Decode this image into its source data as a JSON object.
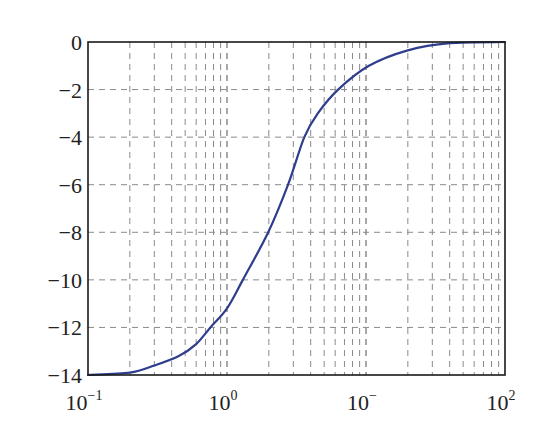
{
  "chart_data": {
    "type": "line",
    "title": "",
    "xlabel": "",
    "ylabel": "",
    "xscale": "log",
    "xlim": [
      0.1,
      100
    ],
    "ylim": [
      -14,
      0
    ],
    "grid": true,
    "grid_style": "dashed",
    "legend": null,
    "x_tick_labels": [
      {
        "base": "10",
        "exp": "−1",
        "value": 0.1
      },
      {
        "base": "10",
        "exp": "0",
        "value": 1
      },
      {
        "base": "10",
        "exp": "−",
        "value": 10
      },
      {
        "base": "10",
        "exp": "2",
        "value": 100
      }
    ],
    "y_ticks": [
      0,
      -2,
      -4,
      -6,
      -8,
      -10,
      -12,
      -14
    ],
    "y_tick_labels": [
      "0",
      "−2",
      "−4",
      "−6",
      "−8",
      "−10",
      "−12",
      "−14"
    ],
    "series": [
      {
        "name": "response",
        "color": "#2e3d8c",
        "x": [
          0.1,
          0.2,
          0.3,
          0.45,
          0.6,
          0.76,
          1.0,
          1.3,
          1.98,
          2.75,
          3.6,
          4.5,
          6.3,
          10.5,
          20,
          40,
          100
        ],
        "y": [
          -14,
          -13.9,
          -13.6,
          -13.2,
          -12.7,
          -12,
          -11.2,
          -10,
          -8,
          -6,
          -4,
          -3.0,
          -2,
          -1,
          -0.35,
          -0.05,
          0
        ]
      }
    ]
  },
  "colors": {
    "axis": "#1a1a1a",
    "grid": "#8a8a8a",
    "line": "#2e3d8c",
    "background": "#ffffff"
  }
}
